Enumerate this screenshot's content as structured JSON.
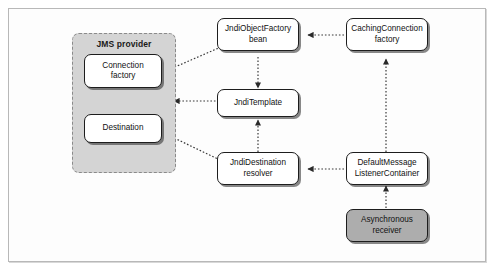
{
  "diagram": {
    "background_color": "#ffffff",
    "frame_color": "#b8b8b8",
    "group": {
      "label": "JMS provider",
      "fill_color": "#d4d4d4",
      "border_color": "#8a8a8a",
      "nodes": [
        {
          "id": "connection-factory",
          "label": "Connection\nfactory",
          "shaded": false
        },
        {
          "id": "destination",
          "label": "Destination",
          "shaded": false
        }
      ]
    },
    "nodes": [
      {
        "id": "jndi-object-factory-bean",
        "label": "JndiObjectFactory\nbean",
        "shaded": false
      },
      {
        "id": "caching-connection-factory",
        "label": "CachingConnection\nfactory",
        "shaded": false
      },
      {
        "id": "jndi-template",
        "label": "JndiTemplate",
        "shaded": false
      },
      {
        "id": "jndi-destination-resolver",
        "label": "JndiDestination\nresolver",
        "shaded": false
      },
      {
        "id": "default-message-listener-container",
        "label": "DefaultMessage\nListenerContainer",
        "shaded": false
      },
      {
        "id": "asynchronous-receiver",
        "label": "Asynchronous\nreceiver",
        "shaded": true
      }
    ],
    "edges": [
      {
        "id": "edge-jndiobjectfactorybean-to-connectionfactory",
        "from": "jndi-object-factory-bean",
        "to": "connection-factory",
        "style": "dotted",
        "arrow": "to"
      },
      {
        "id": "edge-cachingconnectionfactory-to-jndiobjectfactorybean",
        "from": "caching-connection-factory",
        "to": "jndi-object-factory-bean",
        "style": "dotted",
        "arrow": "to"
      },
      {
        "id": "edge-jndiobjectfactorybean-to-jnditemplate",
        "from": "jndi-object-factory-bean",
        "to": "jndi-template",
        "style": "dotted",
        "arrow": "to"
      },
      {
        "id": "edge-jnditemplate-to-jmsprovider",
        "from": "jndi-template",
        "to": "jms-provider",
        "style": "dotted",
        "arrow": "to"
      },
      {
        "id": "edge-jndidestinationresolver-to-jnditemplate",
        "from": "jndi-destination-resolver",
        "to": "jndi-template",
        "style": "dotted",
        "arrow": "to"
      },
      {
        "id": "edge-jndidestinationresolver-to-destination",
        "from": "jndi-destination-resolver",
        "to": "destination",
        "style": "dotted",
        "arrow": "to"
      },
      {
        "id": "edge-defaultmessagelistenercontainer-to-jndidestinationresolver",
        "from": "default-message-listener-container",
        "to": "jndi-destination-resolver",
        "style": "dotted",
        "arrow": "to"
      },
      {
        "id": "edge-defaultmessagelistenercontainer-to-cachingconnectionfactory",
        "from": "default-message-listener-container",
        "to": "caching-connection-factory",
        "style": "dotted",
        "arrow": "to"
      },
      {
        "id": "edge-asynchronousreceiver-to-defaultmessagelistenercontainer",
        "from": "asynchronous-receiver",
        "to": "default-message-listener-container",
        "style": "dotted",
        "arrow": "to"
      }
    ]
  }
}
